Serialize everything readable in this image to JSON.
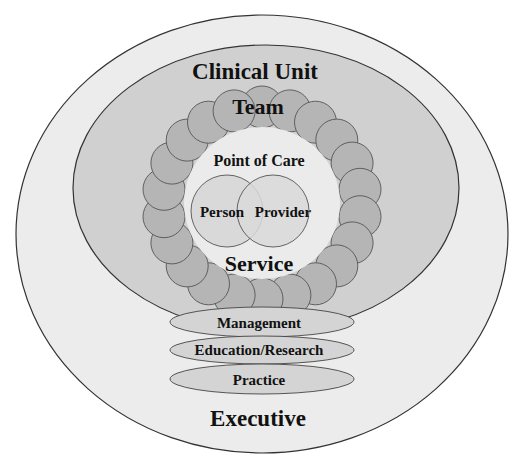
{
  "diagram": {
    "layers": {
      "executive": {
        "label": "Executive",
        "fill": "#ececec"
      },
      "clinical_unit": {
        "label": "Clinical Unit",
        "fill": "#d0d0d0"
      },
      "team": {
        "label": "Team",
        "circle_fill": "#b5b5b5"
      },
      "point_of_care": {
        "label": "Point of Care",
        "fill": "#ebebeb"
      },
      "service": {
        "label": "Service"
      }
    },
    "dyad": {
      "person": {
        "label": "Person",
        "fill": "#d9d9d9"
      },
      "provider": {
        "label": "Provider",
        "fill": "#d9d9d9"
      }
    },
    "pillars": [
      {
        "label": "Management",
        "fill": "#d4d4d4"
      },
      {
        "label": "Education/Research",
        "fill": "#d4d4d4"
      },
      {
        "label": "Practice",
        "fill": "#d4d4d4"
      }
    ],
    "stroke": "#333333"
  }
}
